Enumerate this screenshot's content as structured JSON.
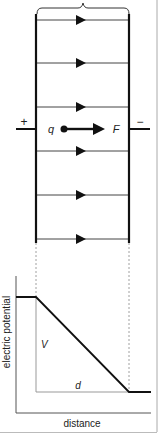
{
  "diagram": {
    "colors": {
      "stroke": "#111111",
      "thin_line": "#444444",
      "gray_line": "#999999",
      "dashed": "#888888",
      "border": "#aaaaaa"
    },
    "capacitor": {
      "left_plate_sign": "+",
      "right_plate_sign": "−",
      "charge_label": "q",
      "force_label": "F",
      "field_line_count": 6,
      "field_line_y": [
        20,
        63,
        107,
        151,
        195,
        239
      ]
    },
    "graph": {
      "y_axis_label": "electric potential",
      "x_axis_label": "distance",
      "voltage_label": "V",
      "distance_label": "d"
    }
  }
}
